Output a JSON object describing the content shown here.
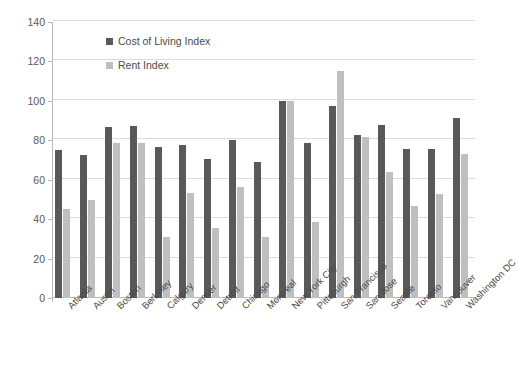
{
  "chart_data": {
    "type": "bar",
    "title": "",
    "xlabel": "",
    "ylabel": "",
    "ylim": [
      0,
      140
    ],
    "ytick_step": 20,
    "yticks": [
      0,
      20,
      40,
      60,
      80,
      100,
      120,
      140
    ],
    "grid": true,
    "legend_position": "inside-top-left",
    "categories": [
      "Atlanta",
      "Austin",
      "Boston",
      "Berkeley",
      "Calgary",
      "Denver",
      "Detroit",
      "Chicago",
      "Montreal",
      "New York City",
      "Pittsburgh",
      "San Francisco",
      "San Jose",
      "Seattle",
      "Toronto",
      "Vancouver",
      "Washington DC"
    ],
    "series": [
      {
        "name": "Cost of Living Index",
        "color": "#595959",
        "values": [
          75,
          72.5,
          87,
          87.5,
          76.5,
          77.5,
          70.5,
          80,
          69,
          100,
          78.5,
          97.5,
          82.5,
          88,
          75.5,
          75.5,
          91.5
        ]
      },
      {
        "name": "Rent Index",
        "color": "#bfbfbf",
        "values": [
          45,
          49.5,
          78.5,
          78.5,
          31,
          53.5,
          35.5,
          56.5,
          31,
          100,
          38.5,
          115,
          81.5,
          64,
          46.5,
          53,
          73
        ]
      }
    ]
  },
  "colors": {
    "cost_of_living": "#595959",
    "rent": "#bfbfbf",
    "gridline": "#dcdcdc",
    "axis": "#b8b8b8",
    "text": "#4a4a4a",
    "background": "#ffffff"
  }
}
